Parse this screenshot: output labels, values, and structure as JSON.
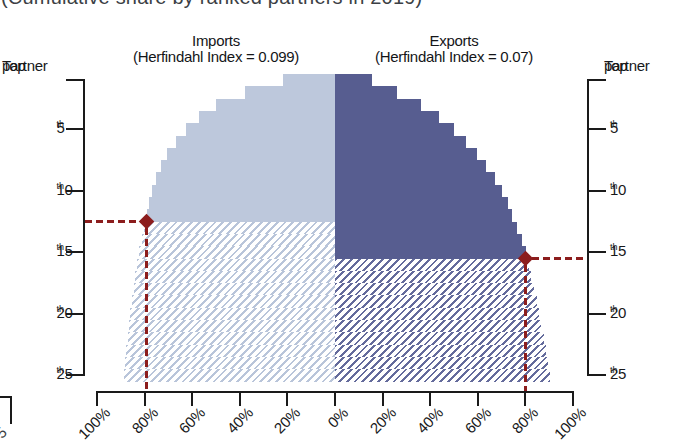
{
  "page_title_cropped": "(Cumulative share by ranked partners in 2019)",
  "edge_fragment": {
    "label": "5"
  },
  "chart_data": {
    "type": "bar",
    "orientation": "tornado-pyramid-horizontal",
    "title": "(Cumulative share by ranked partners in 2019)",
    "panels": [
      {
        "name": "Imports",
        "subtitle": "(Herfindahl Index = 0.099)",
        "herfindahl_index": 0.099,
        "side": "left"
      },
      {
        "name": "Exports",
        "subtitle": "(Herfindahl Index = 0.07)",
        "herfindahl_index": 0.07,
        "side": "right"
      }
    ],
    "rank_axis": {
      "max_rank": 25,
      "ticks": [
        {
          "rank": 1,
          "line1": "Top",
          "line2": "partner"
        },
        {
          "rank": 5,
          "num": "5",
          "sup": "th"
        },
        {
          "rank": 10,
          "num": "10",
          "sup": "th"
        },
        {
          "rank": 15,
          "num": "15",
          "sup": "th"
        },
        {
          "rank": 20,
          "num": "20",
          "sup": "th"
        },
        {
          "rank": 25,
          "num": "25",
          "sup": "th"
        }
      ]
    },
    "x_axis": {
      "unit": "%",
      "tick_values": [
        100,
        80,
        60,
        40,
        20,
        0,
        20,
        40,
        60,
        80,
        100
      ],
      "tick_labels": [
        "100%",
        "80%",
        "60%",
        "40%",
        "20%",
        "0%",
        "20%",
        "40%",
        "60%",
        "80%",
        "100%"
      ]
    },
    "series": [
      {
        "name": "Imports",
        "herfindahl_index": 0.099,
        "solid_through_rank": 12,
        "cumulative_share_pct": [
          22,
          38,
          50,
          57,
          62.5,
          67,
          70.5,
          73.2,
          75.3,
          77,
          78.2,
          79.2,
          80.3,
          81.3,
          82.2,
          83.1,
          83.9,
          84.6,
          85.3,
          86,
          86.6,
          87.2,
          87.8,
          88.3,
          88.8
        ],
        "marker": {
          "rank": 12,
          "cumulative_pct": 79.2
        }
      },
      {
        "name": "Exports",
        "herfindahl_index": 0.07,
        "solid_through_rank": 15,
        "cumulative_share_pct": [
          15.5,
          26,
          36,
          43.5,
          50,
          55,
          59.5,
          63.5,
          67,
          70,
          72.5,
          74.5,
          76.5,
          78.5,
          80.2,
          81.3,
          82.5,
          83.6,
          84.7,
          85.7,
          86.7,
          87.6,
          88.5,
          89.4,
          90.2
        ],
        "marker": {
          "rank": 15,
          "cumulative_pct": 80.2
        }
      }
    ],
    "colors": {
      "imports_solid": "#bdc8dc",
      "imports_hatch": "#b9c5da",
      "exports_solid": "#575d90",
      "exports_hatch": "#646b9c",
      "marker_red": "#8c1d1d",
      "axis": "#1a1a1a"
    }
  }
}
